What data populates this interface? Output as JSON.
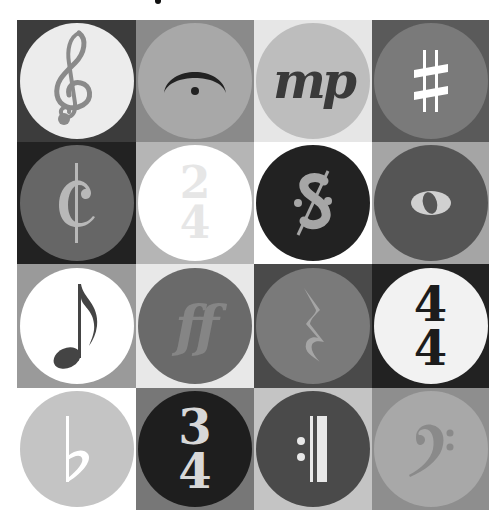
{
  "grid": {
    "rows": 4,
    "columns": 4,
    "tiles": [
      {
        "symbol": "treble-clef",
        "label": "𝄞",
        "background": "#3c3c3c",
        "circle": "#ececec",
        "glyph_color": "#8a8a8a"
      },
      {
        "symbol": "fermata",
        "label": "𝄐",
        "background": "#8a8a8a",
        "circle": "#a8a8a8",
        "glyph_color": "#222222"
      },
      {
        "symbol": "mezzo-piano",
        "label": "mp",
        "background": "#e6e6e6",
        "circle": "#bdbdbd",
        "glyph_color": "#3a3a3a"
      },
      {
        "symbol": "sharp",
        "label": "♯",
        "background": "#5a5a5a",
        "circle": "#7a7a7a",
        "glyph_color": "#ffffff"
      },
      {
        "symbol": "cut-time",
        "label": "¢",
        "background": "#222222",
        "circle": "#666666",
        "glyph_color": "#b8b8b8"
      },
      {
        "symbol": "time-signature-2-4",
        "top": "2",
        "bottom": "4",
        "background": "#b5b5b5",
        "circle": "#ffffff",
        "glyph_color": "#e6e6e6"
      },
      {
        "symbol": "segno",
        "label": "𝄋",
        "background": "#ffffff",
        "circle": "#222222",
        "glyph_color": "#a6a6a6"
      },
      {
        "symbol": "whole-note",
        "label": "𝅝",
        "background": "#a5a5a5",
        "circle": "#555555",
        "glyph_color": "#d0d0d0"
      },
      {
        "symbol": "eighth-note",
        "label": "♪",
        "background": "#9a9a9a",
        "circle": "#ffffff",
        "glyph_color": "#444444"
      },
      {
        "symbol": "fortissimo",
        "label": "ff",
        "background": "#e8e8e8",
        "circle": "#6a6a6a",
        "glyph_color": "#858585"
      },
      {
        "symbol": "quarter-rest",
        "label": "𝄽",
        "background": "#4a4a4a",
        "circle": "#7a7a7a",
        "glyph_color": "#a5a5a5"
      },
      {
        "symbol": "time-signature-4-4",
        "top": "4",
        "bottom": "4",
        "background": "#222222",
        "circle": "#f2f2f2",
        "glyph_color": "#1c1c1c"
      },
      {
        "symbol": "flat",
        "label": "♭",
        "background": "#ffffff",
        "circle": "#c4c4c4",
        "glyph_color": "#ffffff"
      },
      {
        "symbol": "time-signature-3-4",
        "top": "3",
        "bottom": "4",
        "background": "#777777",
        "circle": "#1e1e1e",
        "glyph_color": "#d8d8d8"
      },
      {
        "symbol": "end-repeat",
        "label": "𝄇",
        "background": "#c4c4c4",
        "circle": "#4a4a4a",
        "glyph_color": "#e8e8e8"
      },
      {
        "symbol": "bass-clef",
        "label": "𝄢",
        "background": "#8e8e8e",
        "circle": "#a8a8a8",
        "glyph_color": "#8a8a8a"
      }
    ]
  }
}
